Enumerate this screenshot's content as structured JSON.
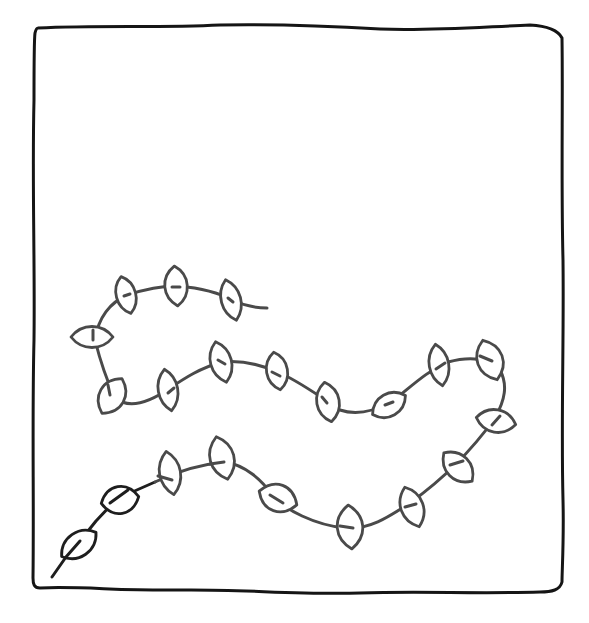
{
  "drawing": {
    "subject": "hand-drawn vine with leaves inside a square frame",
    "colors": {
      "background": "#ffffff",
      "frame": "#151515",
      "stem_dark": "#1e1e1e",
      "stem_gray": "#4a4a4a"
    },
    "frame_corners": [
      [
        35,
        27
      ],
      [
        564,
        35
      ],
      [
        562,
        592
      ],
      [
        33,
        588
      ]
    ],
    "leaf_count": 27
  }
}
